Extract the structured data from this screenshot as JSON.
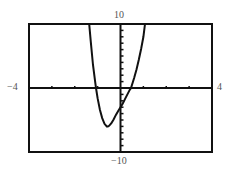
{
  "chart_data": {
    "type": "line",
    "title": "",
    "xlabel": "",
    "ylabel": "",
    "xlim": [
      -4,
      4
    ],
    "ylim": [
      -10,
      10
    ],
    "xscale": 1,
    "yscale": 1,
    "grid": false,
    "window_labels": {
      "xmin": "−4",
      "xmax": "4",
      "ymin": "−10",
      "ymax": "10"
    },
    "series": [
      {
        "name": "f(x)",
        "x": [
          -1.37,
          -1.3,
          -1.2,
          -1.1,
          -1.07,
          -1.0,
          -0.9,
          -0.8,
          -0.7,
          -0.6,
          -0.55,
          -0.5,
          -0.4,
          -0.3,
          -0.2,
          -0.1,
          0.0,
          0.1,
          0.2,
          0.3,
          0.4,
          0.46,
          0.6,
          0.7,
          0.8,
          0.9,
          1.0,
          1.07
        ],
        "y": [
          10,
          7.2,
          3.6,
          0.8,
          0.0,
          -1.6,
          -3.4,
          -4.7,
          -5.6,
          -6.0,
          -6.0,
          -5.9,
          -5.5,
          -4.9,
          -4.2,
          -3.6,
          -3.0,
          -2.4,
          -1.7,
          -1.0,
          -0.3,
          0.0,
          1.6,
          2.9,
          4.4,
          6.1,
          8.0,
          10
        ]
      }
    ]
  }
}
